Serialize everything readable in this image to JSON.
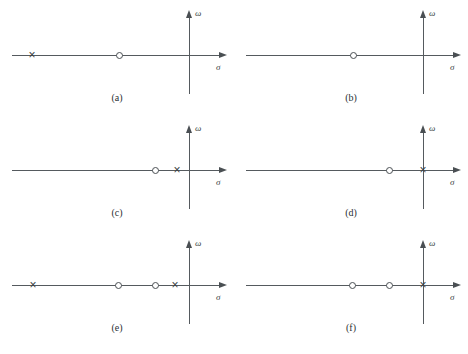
{
  "figure": {
    "axis_labels": {
      "real": "σ",
      "imag": "ω"
    },
    "marker_names": {
      "pole": "pole-marker-x",
      "zero": "zero-marker-o"
    },
    "colors": {
      "axis": "#555a5e",
      "marker": "#4a4f53",
      "text": "#2a2f33"
    },
    "caption": "",
    "panels": [
      {
        "id": "a",
        "caption": "(a)",
        "origin_x": 189,
        "axis_y": 55,
        "line_start_x": 12,
        "line_end_x": 219,
        "imag_top_y": 18,
        "imag_bottom_y": 94,
        "poles": [
          32
        ],
        "zeros": [
          119
        ]
      },
      {
        "id": "b",
        "caption": "(b)",
        "origin_x": 189,
        "axis_y": 55,
        "line_start_x": 12,
        "line_end_x": 219,
        "imag_top_y": 18,
        "imag_bottom_y": 94,
        "poles": [],
        "zeros": [
          119
        ]
      },
      {
        "id": "c",
        "caption": "(c)",
        "origin_x": 189,
        "axis_y": 55,
        "line_start_x": 12,
        "line_end_x": 219,
        "imag_top_y": 18,
        "imag_bottom_y": 94,
        "poles": [
          177
        ],
        "zeros": [
          155
        ]
      },
      {
        "id": "d",
        "caption": "(d)",
        "origin_x": 189,
        "axis_y": 55,
        "line_start_x": 12,
        "line_end_x": 219,
        "imag_top_y": 18,
        "imag_bottom_y": 94,
        "poles": [
          189
        ],
        "zeros": [
          155
        ]
      },
      {
        "id": "e",
        "caption": "(e)",
        "origin_x": 189,
        "axis_y": 55,
        "line_start_x": 12,
        "line_end_x": 219,
        "imag_top_y": 18,
        "imag_bottom_y": 94,
        "poles": [
          33,
          175
        ],
        "zeros": [
          118,
          155
        ]
      },
      {
        "id": "f",
        "caption": "(f)",
        "origin_x": 189,
        "axis_y": 55,
        "line_start_x": 12,
        "line_end_x": 219,
        "imag_top_y": 18,
        "imag_bottom_y": 94,
        "poles": [
          189
        ],
        "zeros": [
          118,
          155
        ]
      }
    ]
  }
}
